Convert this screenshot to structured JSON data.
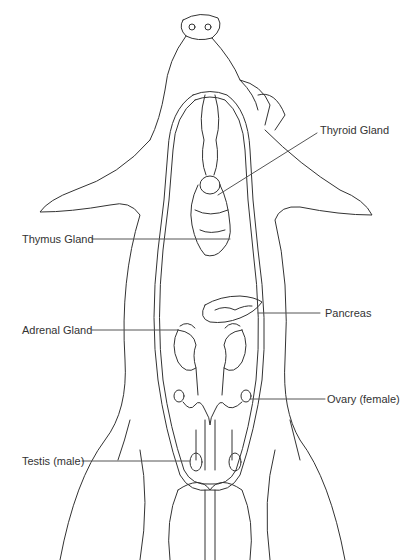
{
  "diagram": {
    "labels": [
      {
        "id": "thyroid",
        "text": "Thyroid Gland",
        "side": "right"
      },
      {
        "id": "thymus",
        "text": "Thymus Gland",
        "side": "left"
      },
      {
        "id": "pancreas",
        "text": "Pancreas",
        "side": "right"
      },
      {
        "id": "adrenal",
        "text": "Adrenal Gland",
        "side": "left"
      },
      {
        "id": "ovary",
        "text": "Ovary (female)",
        "side": "right"
      },
      {
        "id": "testis",
        "text": "Testis (male)",
        "side": "left"
      }
    ],
    "colors": {
      "line": "#333333",
      "text": "#333333",
      "background": "#ffffff"
    }
  }
}
